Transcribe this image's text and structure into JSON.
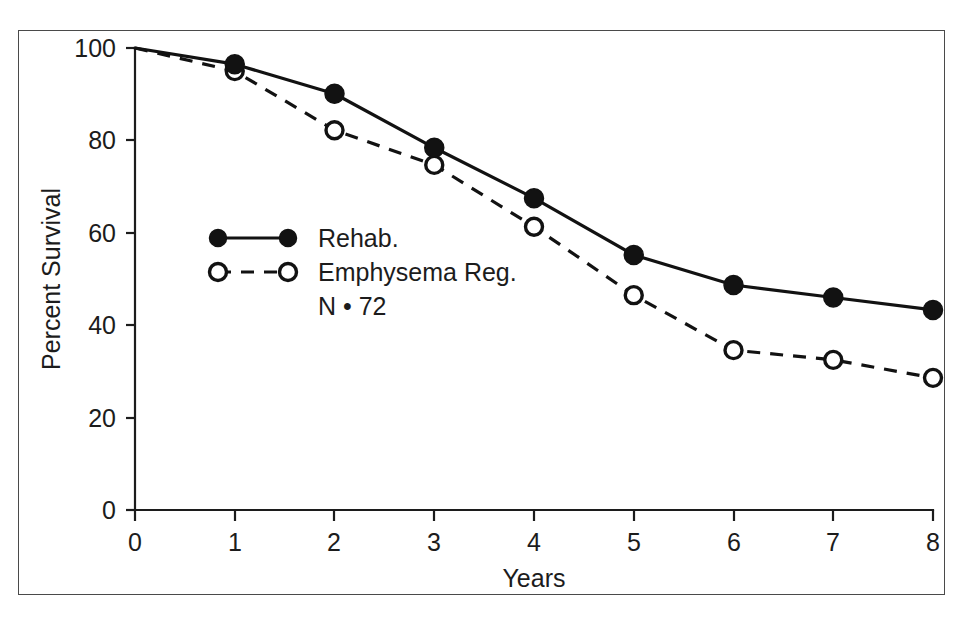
{
  "chart_data": {
    "type": "line",
    "title": "",
    "subtitle": "",
    "xlabel": "Years",
    "ylabel": "Percent Survival",
    "x": [
      0,
      1,
      2,
      3,
      4,
      5,
      6,
      7,
      8
    ],
    "xlim": [
      0,
      8
    ],
    "ylim": [
      0,
      100
    ],
    "xticks": [
      "0",
      "1",
      "2",
      "3",
      "4",
      "5",
      "6",
      "7",
      "8"
    ],
    "yticks": [
      "0",
      "20",
      "40",
      "60",
      "80",
      "100"
    ],
    "ytick_values": [
      0,
      20,
      40,
      60,
      80,
      100
    ],
    "grid": false,
    "legend_position": "inside-left-middle",
    "annotations": [
      "N • 72"
    ],
    "series": [
      {
        "name": "Rehab.",
        "marker": "filled-circle",
        "linestyle": "solid",
        "color": "#121212",
        "values": [
          100,
          96.5,
          90.1,
          78.4,
          67.5,
          55.2,
          48.7,
          46.0,
          43.3
        ]
      },
      {
        "name": "Emphysema Reg.",
        "marker": "open-circle",
        "linestyle": "dashed",
        "color": "#121212",
        "values": [
          100,
          95.0,
          82.2,
          74.7,
          61.3,
          46.5,
          34.6,
          32.5,
          28.6
        ]
      }
    ]
  },
  "legend": {
    "entries": [
      {
        "label": "Rehab."
      },
      {
        "label": "Emphysema Reg."
      }
    ],
    "note": "N • 72"
  },
  "axes": {
    "x_title": "Years",
    "y_title": "Percent Survival"
  },
  "colors": {
    "ink": "#121212",
    "frame": "#4a4a4a",
    "background": "#ffffff"
  }
}
